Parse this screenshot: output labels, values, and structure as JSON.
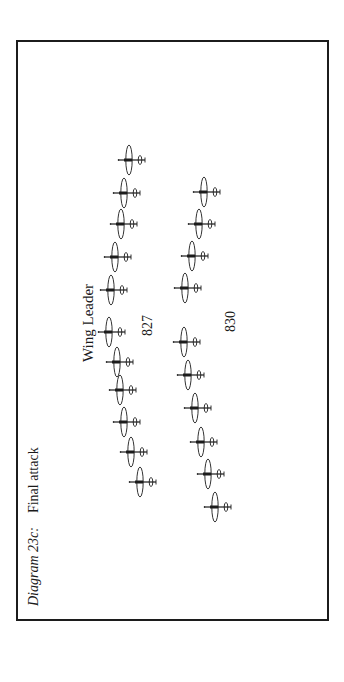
{
  "figure": {
    "caption_label": "Diagram 23c:",
    "caption_title": "Final attack",
    "wing_leader_label": "Wing Leader",
    "squadron_left": "827",
    "squadron_right": "830",
    "orientation": "rotated -90deg; aircraft shown from above, nose toward caption",
    "line_color": "#1c1c1c"
  },
  "formation": {
    "left_column_squadron": "827",
    "right_column_squadron": "830",
    "left_column": [
      {
        "x": 130,
        "y": 160
      },
      {
        "x": 125,
        "y": 193
      },
      {
        "x": 122,
        "y": 224
      },
      {
        "x": 116,
        "y": 257
      },
      {
        "x": 112,
        "y": 290
      },
      {
        "x": 110,
        "y": 332
      },
      {
        "x": 118,
        "y": 362
      },
      {
        "x": 121,
        "y": 390
      },
      {
        "x": 125,
        "y": 422
      },
      {
        "x": 132,
        "y": 452
      },
      {
        "x": 141,
        "y": 482
      }
    ],
    "right_column": [
      {
        "x": 205,
        "y": 192
      },
      {
        "x": 200,
        "y": 224
      },
      {
        "x": 193,
        "y": 256
      },
      {
        "x": 186,
        "y": 288
      },
      {
        "x": 185,
        "y": 342
      },
      {
        "x": 189,
        "y": 375
      },
      {
        "x": 196,
        "y": 408
      },
      {
        "x": 202,
        "y": 442
      },
      {
        "x": 209,
        "y": 474
      },
      {
        "x": 216,
        "y": 507
      }
    ]
  }
}
